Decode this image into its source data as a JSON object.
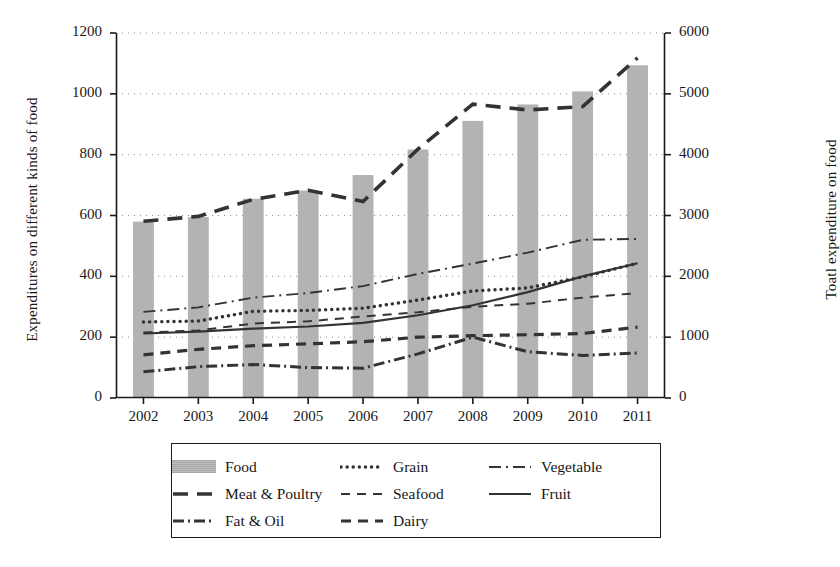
{
  "chart_data": {
    "type": "bar",
    "title": "",
    "xlabel": "",
    "ylabel": "Expenditures on different kinds of food",
    "ylabel_right": "Toatl expenditure on food",
    "categories": [
      "2002",
      "2003",
      "2004",
      "2005",
      "2006",
      "2007",
      "2008",
      "2009",
      "2010",
      "2011"
    ],
    "ylim": [
      0,
      1200
    ],
    "ylim_right": [
      0,
      6000
    ],
    "yticks": [
      "0",
      "200",
      "400",
      "600",
      "800",
      "1000",
      "1200"
    ],
    "yticks_right": [
      "0",
      "1000",
      "2000",
      "3000",
      "4000",
      "5000",
      "6000"
    ],
    "grid": true,
    "legend_position": "below-axes",
    "series": [
      {
        "name": "Food",
        "axis": "right",
        "style": "bar",
        "values": [
          2900,
          2975,
          3275,
          3410,
          3665,
          4085,
          4555,
          4825,
          5040,
          5470
        ]
      },
      {
        "name": "Grain",
        "axis": "left",
        "style": "dotted",
        "values": [
          250,
          253,
          285,
          288,
          295,
          322,
          352,
          362,
          398,
          443
        ]
      },
      {
        "name": "Vegetable",
        "axis": "left",
        "style": "dashdot",
        "values": [
          283,
          298,
          330,
          345,
          368,
          408,
          442,
          478,
          520,
          523
        ]
      },
      {
        "name": "Meat & Poultry",
        "axis": "right",
        "style": "longdash",
        "values": [
          2905,
          2985,
          3265,
          3415,
          3230,
          4090,
          4830,
          4735,
          4790,
          5590
        ]
      },
      {
        "name": "Seafood",
        "axis": "left",
        "style": "dashed",
        "values": [
          215,
          222,
          245,
          252,
          268,
          282,
          300,
          310,
          330,
          345
        ]
      },
      {
        "name": "Fruit",
        "axis": "left",
        "style": "solid",
        "values": [
          212,
          218,
          228,
          235,
          247,
          272,
          305,
          348,
          400,
          443
        ]
      },
      {
        "name": "Fat & Oil",
        "axis": "left",
        "style": "dashdotdot",
        "values": [
          86,
          103,
          110,
          100,
          98,
          145,
          200,
          152,
          140,
          148
        ]
      },
      {
        "name": "Dairy",
        "axis": "left",
        "style": "dashed2",
        "values": [
          142,
          160,
          172,
          178,
          185,
          200,
          205,
          208,
          212,
          233
        ]
      }
    ]
  },
  "legend": {
    "rows": [
      [
        {
          "label": "Food",
          "style": "bar"
        },
        {
          "label": "Grain",
          "style": "dotted"
        },
        {
          "label": "Vegetable",
          "style": "dashdot"
        }
      ],
      [
        {
          "label": "Meat & Poultry",
          "style": "longdash"
        },
        {
          "label": "Seafood",
          "style": "dashed"
        },
        {
          "label": "Fruit",
          "style": "solid"
        }
      ],
      [
        {
          "label": "Fat & Oil",
          "style": "dashdotdot"
        },
        {
          "label": "Dairy",
          "style": "dashed2"
        }
      ]
    ]
  },
  "colors": {
    "bar_fill": "#b3b3b3",
    "line": "#333333",
    "axis": "#1a1a1a",
    "grid": "#8c8c8c",
    "background": "#ffffff"
  }
}
